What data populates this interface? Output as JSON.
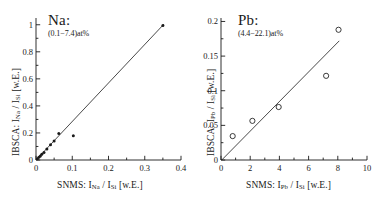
{
  "figure": {
    "background": "#ffffff",
    "ink": "#1a1a1a"
  },
  "chart_data": [
    {
      "id": "na",
      "type": "scatter",
      "title": "",
      "annotation_species": "Na:",
      "annotation_range": "(0.1−7.4)at%",
      "xlabel": "SNMS: I_Na / I_Si [w.E.]",
      "ylabel": "IBSCA: I_Na / I_Si [w.E.]",
      "xlabel_parts": {
        "prefix": "SNMS:",
        "num": "I",
        "num_sub": "Na",
        "slash": "/",
        "den": "I",
        "den_sub": "Si",
        "unit": "[w.E.]"
      },
      "ylabel_parts": {
        "prefix": "IBSCA:",
        "num": "I",
        "num_sub": "Na",
        "slash": "/",
        "den": "I",
        "den_sub": "Si",
        "unit": "[w.E.]"
      },
      "xlim": [
        0,
        0.4
      ],
      "ylim": [
        0,
        1.05
      ],
      "xticks": [
        0,
        0.1,
        0.2,
        0.3,
        0.4
      ],
      "xticklabels": [
        "0",
        "0.1",
        "0.2",
        "0.3",
        "0.4"
      ],
      "yticks": [
        0,
        0.2,
        0.4,
        0.6,
        0.8,
        1.0
      ],
      "yticklabels": [
        "0",
        "0.2",
        "0.4",
        "0.6",
        "0.8",
        "1"
      ],
      "minor_xticks": [
        0.05,
        0.15,
        0.25,
        0.35
      ],
      "minor_yticks": [
        0.1,
        0.3,
        0.5,
        0.7,
        0.9
      ],
      "grid": false,
      "marker": "filled-dot",
      "points": [
        {
          "x": 0.004,
          "y": 0.01
        },
        {
          "x": 0.008,
          "y": 0.02
        },
        {
          "x": 0.012,
          "y": 0.03
        },
        {
          "x": 0.016,
          "y": 0.042
        },
        {
          "x": 0.022,
          "y": 0.055
        },
        {
          "x": 0.03,
          "y": 0.082
        },
        {
          "x": 0.04,
          "y": 0.112
        },
        {
          "x": 0.05,
          "y": 0.14
        },
        {
          "x": 0.063,
          "y": 0.196
        },
        {
          "x": 0.103,
          "y": 0.18
        },
        {
          "x": 0.35,
          "y": 0.995
        }
      ],
      "fit_line": {
        "x0": 0.0,
        "y0": 0.0,
        "x1": 0.353,
        "y1": 1.005
      }
    },
    {
      "id": "pb",
      "type": "scatter",
      "title": "",
      "annotation_species": "Pb:",
      "annotation_range": "(4.4−22.1)at%",
      "xlabel": "SNMS: I_Pb / I_Si [w.E.]",
      "ylabel": "IBSCA: I_Pb / I_Si [w.E.]",
      "xlabel_parts": {
        "prefix": "SNMS:",
        "num": "I",
        "num_sub": "Pb",
        "slash": "/",
        "den": "I",
        "den_sub": "Si",
        "unit": "[w.E.]"
      },
      "ylabel_parts": {
        "prefix": "IBSCA:",
        "num": "I",
        "num_sub": "Pb",
        "slash": "/",
        "den": "I",
        "den_sub": "Si",
        "unit": "[w.E.]"
      },
      "xlim": [
        0,
        10
      ],
      "ylim": [
        0,
        0.205
      ],
      "xticks": [
        0,
        2,
        4,
        6,
        8,
        10
      ],
      "xticklabels": [
        "0",
        "2",
        "4",
        "6",
        "8",
        "10"
      ],
      "yticks": [
        0,
        0.05,
        0.1,
        0.15,
        0.2
      ],
      "yticklabels": [
        "0",
        "0.05",
        "0.1",
        "0.15",
        "0.2"
      ],
      "minor_xticks": [
        1,
        3,
        5,
        7,
        9
      ],
      "minor_yticks": [
        0.025,
        0.075,
        0.125,
        0.175
      ],
      "grid": false,
      "marker": "open-circle",
      "points": [
        {
          "x": 0.8,
          "y": 0.0345
        },
        {
          "x": 2.15,
          "y": 0.0565
        },
        {
          "x": 3.95,
          "y": 0.0765
        },
        {
          "x": 7.2,
          "y": 0.1215
        },
        {
          "x": 8.05,
          "y": 0.188
        }
      ],
      "fit_line": {
        "x0": 0.05,
        "y0": 0.0,
        "x1": 8.1,
        "y1": 0.172
      }
    }
  ]
}
